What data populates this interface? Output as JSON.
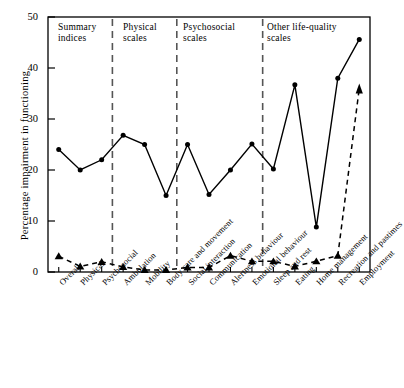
{
  "chart_data": {
    "type": "line",
    "title": "",
    "xlabel": "",
    "ylabel": "Percentage impairment in functioning",
    "ylim": [
      0,
      50
    ],
    "yticks": [
      0,
      10,
      20,
      30,
      40,
      50
    ],
    "grid": false,
    "legend_position": "none",
    "categories": [
      "Overall",
      "Physical",
      "Psychosocial",
      "Ambulation",
      "Mobility",
      "Body care and movement",
      "Social interaction",
      "Communication",
      "Alertness behaviour",
      "Emotional behaviour",
      "Sleep and rest",
      "Eating",
      "Home management",
      "Recreation and pastimes",
      "Employment"
    ],
    "series": [
      {
        "name": "upper",
        "style": "solid",
        "marker": "circle",
        "values": [
          24.0,
          20.0,
          22.0,
          26.8,
          25.0,
          15.0,
          25.0,
          15.2,
          20.0,
          25.1,
          20.2,
          36.7,
          8.8,
          38.0,
          43.8
        ],
        "last_point_value": 45.6,
        "note": "final plotted point at Employment is 45.6"
      },
      {
        "name": "lower",
        "style": "dashed",
        "marker": "triangle",
        "values": [
          3.1,
          1.1,
          2.0,
          1.0,
          0.4,
          0.4,
          0.9,
          0.9,
          3.2,
          2.1,
          2.1,
          1.1,
          2.1,
          3.2,
          36.0
        ],
        "last_marker": "arrow-up",
        "note": "final segment rises steeply to an up-arrow at Employment"
      }
    ],
    "group_dividers": [
      {
        "after_category_index": 2,
        "style": "dashed"
      },
      {
        "after_category_index": 5,
        "style": "dashed"
      },
      {
        "after_category_index": 9,
        "style": "dashed"
      }
    ],
    "group_labels": [
      {
        "text": "Summary\nindices",
        "start_index": 0,
        "end_index": 2
      },
      {
        "text": "Physical\nscales",
        "start_index": 3,
        "end_index": 5
      },
      {
        "text": "Psychosocial\nscales",
        "start_index": 6,
        "end_index": 9
      },
      {
        "text": "Other life-quality\nscales",
        "start_index": 10,
        "end_index": 14
      }
    ],
    "colors": {
      "line": "#000000",
      "divider": "#555555",
      "axis": "#000000",
      "background": "#ffffff"
    }
  }
}
